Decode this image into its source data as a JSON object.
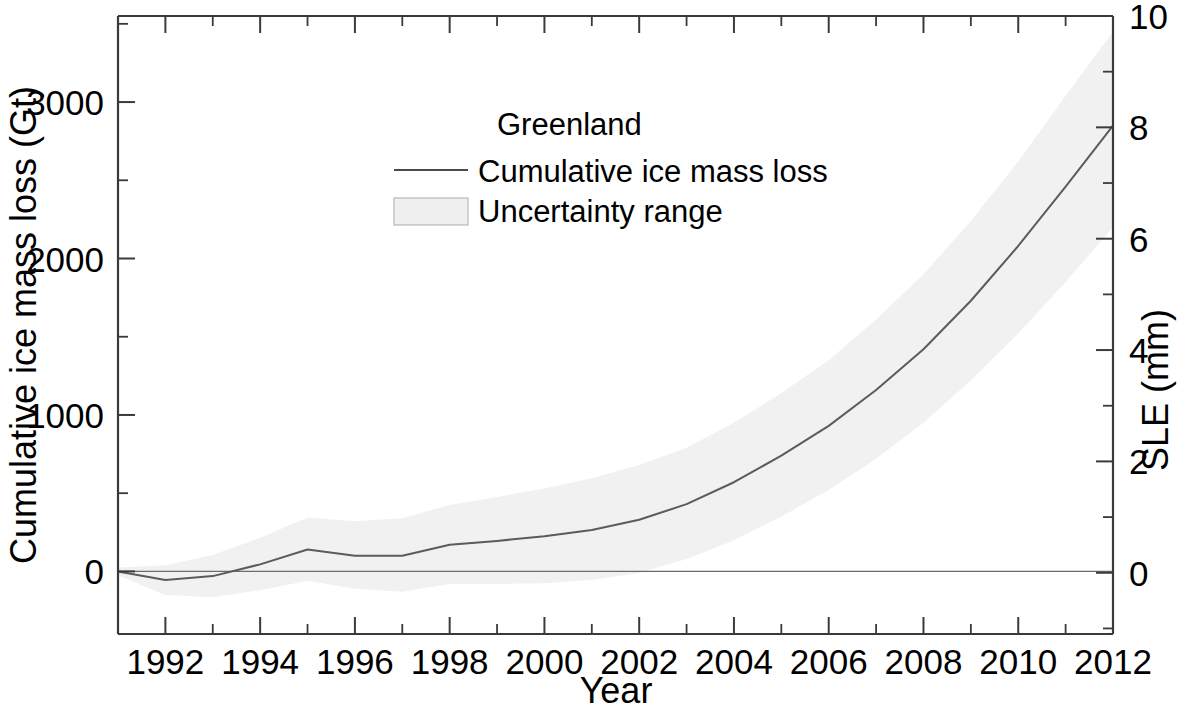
{
  "chart_data": {
    "type": "line",
    "title": "",
    "xlabel": "Year",
    "ylabel": "Cumulative ice mass loss (Gt)",
    "y2label": "SLE (mm)",
    "xlim": [
      1991,
      2012
    ],
    "ylim": [
      -400,
      3550
    ],
    "y2lim": [
      -1.1,
      10.0
    ],
    "grid": false,
    "legend_position": "upper-center",
    "legend_title": "Greenland",
    "x_tick_labels": [
      "1992",
      "1994",
      "1996",
      "1998",
      "2000",
      "2002",
      "2004",
      "2006",
      "2008",
      "2010",
      "2012"
    ],
    "x_major_ticks": [
      1992,
      1994,
      1996,
      1998,
      2000,
      2002,
      2004,
      2006,
      2008,
      2010,
      2012
    ],
    "x_minor_ticks": [
      1991,
      1993,
      1995,
      1997,
      1999,
      2001,
      2003,
      2005,
      2007,
      2009,
      2011
    ],
    "y_tick_labels": [
      "0",
      "1000",
      "2000",
      "3000"
    ],
    "y_major_ticks": [
      0,
      1000,
      2000,
      3000
    ],
    "y_minor_ticks": [
      -500,
      500,
      1500,
      2500,
      3500
    ],
    "y2_tick_labels": [
      "0",
      "2",
      "4",
      "6",
      "8",
      "10"
    ],
    "y2_major_ticks": [
      0,
      2,
      4,
      6,
      8,
      10
    ],
    "y2_minor_ticks": [
      -1,
      1,
      3,
      5,
      7,
      9
    ],
    "series": [
      {
        "name": "Cumulative ice mass loss",
        "color": "#5b5b5b",
        "x": [
          1991.0,
          1992.0,
          1993.0,
          1994.0,
          1995.0,
          1996.0,
          1997.0,
          1998.0,
          1999.0,
          2000.0,
          2001.0,
          2002.0,
          2003.0,
          2004.0,
          2005.0,
          2006.0,
          2007.0,
          2008.0,
          2009.0,
          2010.0,
          2011.0,
          2012.0
        ],
        "values": [
          0,
          -55,
          -30,
          45,
          140,
          100,
          100,
          170,
          195,
          225,
          265,
          330,
          430,
          570,
          740,
          930,
          1160,
          1420,
          1730,
          2080,
          2460,
          2850
        ]
      }
    ],
    "uncertainty": {
      "name": "Uncertainty range",
      "color": "#f1f1f1",
      "x": [
        1991.0,
        1992.0,
        1993.0,
        1994.0,
        1995.0,
        1996.0,
        1997.0,
        1998.0,
        1999.0,
        2000.0,
        2001.0,
        2002.0,
        2003.0,
        2004.0,
        2005.0,
        2006.0,
        2007.0,
        2008.0,
        2009.0,
        2010.0,
        2011.0,
        2012.0
      ],
      "lower": [
        -25,
        -150,
        -165,
        -120,
        -60,
        -110,
        -130,
        -80,
        -80,
        -75,
        -55,
        -10,
        80,
        200,
        350,
        520,
        720,
        950,
        1220,
        1520,
        1850,
        2200
      ],
      "upper": [
        25,
        40,
        105,
        215,
        345,
        320,
        340,
        425,
        475,
        530,
        595,
        680,
        790,
        950,
        1140,
        1350,
        1610,
        1900,
        2240,
        2620,
        3040,
        3450
      ]
    }
  },
  "legend": {
    "title": "Greenland",
    "items": [
      {
        "label": "Cumulative ice mass loss",
        "marker": "line"
      },
      {
        "label": "Uncertainty range",
        "marker": "box"
      }
    ]
  },
  "axes": {
    "left_title": "Cumulative ice mass loss (Gt)",
    "right_title": "SLE (mm)",
    "bottom_title": "Year"
  }
}
